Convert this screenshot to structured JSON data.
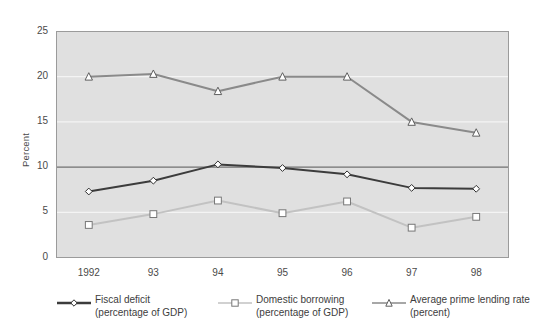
{
  "chart_data": {
    "type": "line",
    "title": "",
    "xlabel": "",
    "ylabel": "Percent",
    "categories": [
      "1992",
      "93",
      "94",
      "95",
      "96",
      "97",
      "98"
    ],
    "ylim": [
      0,
      25
    ],
    "yticks": [
      0,
      5,
      10,
      15,
      20,
      25
    ],
    "grid": true,
    "legend_position": "bottom",
    "series": [
      {
        "name": "Fiscal deficit",
        "sub": "(percentage  of GDP)",
        "marker": "diamond",
        "color": "#3c3c3c",
        "values": [
          7.3,
          8.5,
          10.3,
          9.9,
          9.2,
          7.7,
          7.6
        ]
      },
      {
        "name": "Domestic borrowing",
        "sub": "(percentage  of GDP)",
        "marker": "square",
        "color": "#c2c2c2",
        "values": [
          3.6,
          4.8,
          6.3,
          4.9,
          6.2,
          3.3,
          4.5
        ]
      },
      {
        "name": "Average prime lending rate",
        "sub": "(percent)",
        "marker": "triangle",
        "color": "#8a8a8a",
        "values": [
          20.0,
          20.3,
          18.4,
          20.0,
          20.0,
          15.0,
          13.8
        ]
      }
    ]
  },
  "axis": {
    "ylabel": "Percent",
    "yticks": [
      "0",
      "5",
      "10",
      "15",
      "20",
      "25"
    ],
    "xticks": [
      "1992",
      "93",
      "94",
      "95",
      "96",
      "97",
      "98"
    ]
  },
  "legend": {
    "items": [
      {
        "label": "Fiscal deficit",
        "sub": "(percentage  of GDP)"
      },
      {
        "label": "Domestic borrowing",
        "sub": "(percentage  of GDP)"
      },
      {
        "label": "Average prime lending rate",
        "sub": "(percent)"
      }
    ]
  },
  "style": {
    "plot_background": "#e0e0e0",
    "gridline_color": "#f4f4f4",
    "zero_emphasis_color": "#555555",
    "frame_color": "#9b9b9b"
  }
}
